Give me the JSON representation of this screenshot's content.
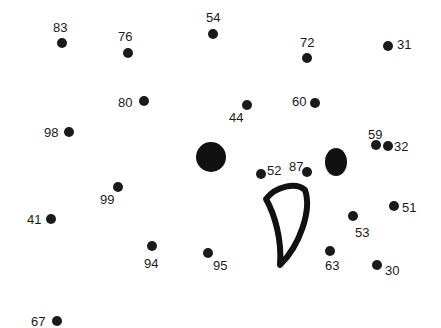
{
  "puzzle": {
    "type": "connect-the-dots",
    "ink_color": "#1a1a1a",
    "background": "#ffffff",
    "points": [
      {
        "n": "83",
        "x": 62,
        "y": 43,
        "lx": 53,
        "ly": 21
      },
      {
        "n": "76",
        "x": 128,
        "y": 53,
        "lx": 118,
        "ly": 30
      },
      {
        "n": "54",
        "x": 213,
        "y": 34,
        "lx": 206,
        "ly": 11
      },
      {
        "n": "72",
        "x": 307,
        "y": 58,
        "lx": 300,
        "ly": 36
      },
      {
        "n": "31",
        "x": 388,
        "y": 46,
        "lx": 397,
        "ly": 38
      },
      {
        "n": "80",
        "x": 144,
        "y": 101,
        "lx": 118,
        "ly": 96
      },
      {
        "n": "44",
        "x": 247,
        "y": 105,
        "lx": 229,
        "ly": 111
      },
      {
        "n": "60",
        "x": 315,
        "y": 103,
        "lx": 292,
        "ly": 95
      },
      {
        "n": "98",
        "x": 69,
        "y": 132,
        "lx": 44,
        "ly": 126
      },
      {
        "n": "59",
        "x": 376,
        "y": 145,
        "lx": 368,
        "ly": 128
      },
      {
        "n": "32",
        "x": 388,
        "y": 146,
        "lx": 394,
        "ly": 140
      },
      {
        "n": "52",
        "x": 261,
        "y": 174,
        "lx": 267,
        "ly": 164
      },
      {
        "n": "87",
        "x": 307,
        "y": 172,
        "lx": 289,
        "ly": 160
      },
      {
        "n": "99",
        "x": 118,
        "y": 187,
        "lx": 100,
        "ly": 193
      },
      {
        "n": "41",
        "x": 51,
        "y": 219,
        "lx": 27,
        "ly": 213
      },
      {
        "n": "51",
        "x": 394,
        "y": 206,
        "lx": 402,
        "ly": 201
      },
      {
        "n": "53",
        "x": 353,
        "y": 216,
        "lx": 355,
        "ly": 226
      },
      {
        "n": "94",
        "x": 152,
        "y": 246,
        "lx": 144,
        "ly": 257
      },
      {
        "n": "95",
        "x": 208,
        "y": 253,
        "lx": 213,
        "ly": 259
      },
      {
        "n": "63",
        "x": 330,
        "y": 251,
        "lx": 325,
        "ly": 259
      },
      {
        "n": "30",
        "x": 377,
        "y": 265,
        "lx": 385,
        "ly": 264
      },
      {
        "n": "67",
        "x": 57,
        "y": 321,
        "lx": 31,
        "ly": 315
      }
    ],
    "eyes": [
      {
        "name": "left-eye",
        "cx": 211,
        "cy": 157,
        "rx": 15,
        "ry": 15
      },
      {
        "name": "right-eye",
        "cx": 336,
        "cy": 162,
        "rx": 11,
        "ry": 14
      }
    ],
    "beak": {
      "path": "M266,199 C276,186 296,182 305,190 C312,210 300,245 280,265 C282,240 275,215 266,199 Z",
      "stroke": "#111111",
      "stroke_width": 6
    }
  }
}
